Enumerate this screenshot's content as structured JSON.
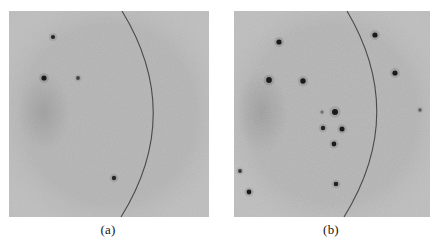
{
  "figure": {
    "kind": "two-panel-grayscale-detector-image",
    "background_color": "#ffffff",
    "panel_fill_color": "#b5b5b5",
    "panel_noise_color": "#9d9d9d",
    "spot_color": "#1a1a1a",
    "arc_color": "#4a4a4a",
    "width": 440,
    "height": 246
  },
  "panels": [
    {
      "id": "panel-a",
      "caption": "(a)",
      "caption_x": 108,
      "caption_y": 222,
      "frame": {
        "x": 9,
        "y": 11,
        "w": 200,
        "h": 206
      },
      "arc": {
        "start": {
          "x": 122,
          "y": 11
        },
        "control": {
          "x": 185,
          "y": 114
        },
        "end": {
          "x": 121,
          "y": 217
        },
        "stroke_width": 1.1
      },
      "spots": [
        {
          "x": 53,
          "y": 37,
          "r": 2.1,
          "opacity": 0.92
        },
        {
          "x": 44,
          "y": 78,
          "r": 2.6,
          "opacity": 1.0
        },
        {
          "x": 78,
          "y": 78,
          "r": 1.9,
          "opacity": 0.72
        },
        {
          "x": 114,
          "y": 178,
          "r": 2.2,
          "opacity": 0.9
        }
      ],
      "spot_count": 4,
      "blob": {
        "cx": 44,
        "cy": 112,
        "rx": 26,
        "ry": 40,
        "opacity": 0.2
      }
    },
    {
      "id": "panel-b",
      "caption": "(b)",
      "caption_x": 331,
      "caption_y": 222,
      "frame": {
        "x": 234,
        "y": 11,
        "w": 196,
        "h": 206
      },
      "arc": {
        "start": {
          "x": 347,
          "y": 11
        },
        "control": {
          "x": 408,
          "y": 114
        },
        "end": {
          "x": 344,
          "y": 217
        },
        "stroke_width": 1.1
      },
      "spots": [
        {
          "x": 279,
          "y": 42,
          "r": 2.6,
          "opacity": 1.0
        },
        {
          "x": 269,
          "y": 80,
          "r": 2.9,
          "opacity": 1.0
        },
        {
          "x": 303,
          "y": 81,
          "r": 2.7,
          "opacity": 1.0
        },
        {
          "x": 375,
          "y": 35,
          "r": 2.6,
          "opacity": 1.0
        },
        {
          "x": 395,
          "y": 73,
          "r": 2.6,
          "opacity": 1.0
        },
        {
          "x": 322,
          "y": 112,
          "r": 1.5,
          "opacity": 0.45
        },
        {
          "x": 335,
          "y": 112,
          "r": 3.0,
          "opacity": 1.0
        },
        {
          "x": 323,
          "y": 128,
          "r": 2.2,
          "opacity": 0.95
        },
        {
          "x": 342,
          "y": 129,
          "r": 2.5,
          "opacity": 1.0
        },
        {
          "x": 334,
          "y": 144,
          "r": 2.4,
          "opacity": 1.0
        },
        {
          "x": 420,
          "y": 110,
          "r": 1.7,
          "opacity": 0.55
        },
        {
          "x": 240,
          "y": 171,
          "r": 1.9,
          "opacity": 0.8
        },
        {
          "x": 249,
          "y": 192,
          "r": 2.4,
          "opacity": 1.0
        },
        {
          "x": 336,
          "y": 184,
          "r": 2.3,
          "opacity": 0.95
        }
      ],
      "spot_count": 14,
      "blob": {
        "cx": 262,
        "cy": 112,
        "rx": 26,
        "ry": 42,
        "opacity": 0.2
      }
    }
  ]
}
